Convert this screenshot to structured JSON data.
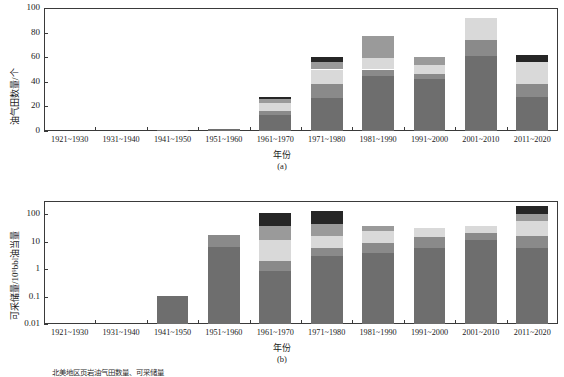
{
  "figure": {
    "caption": "北美地区页岩油气田数量、可采储量",
    "width": 564,
    "height": 377
  },
  "series": [
    {
      "name": "series-1",
      "color": "#6e6e6e"
    },
    {
      "name": "series-2",
      "color": "#8a8a8a"
    },
    {
      "name": "series-3",
      "color": "#d9d9d9"
    },
    {
      "name": "series-4",
      "color": "#9a9a9a"
    },
    {
      "name": "series-5",
      "color": "#262626"
    }
  ],
  "chart_data": [
    {
      "type": "bar",
      "id": "a",
      "subcaption": "(a)",
      "title": "",
      "xlabel": "年份",
      "ylabel": "油气田数量/个",
      "scale": "linear",
      "ylim": [
        0,
        100
      ],
      "yticks": [
        0,
        20,
        40,
        60,
        80,
        100
      ],
      "ytick_labels": [
        "0",
        "20",
        "40",
        "60",
        "80",
        "100"
      ],
      "grid": false,
      "legend": "none",
      "categories": [
        "1921~1930",
        "1931~1940",
        "1941~1950",
        "1951~1960",
        "1961~1970",
        "1971~1980",
        "1981~1990",
        "1991~2000",
        "2001~2010",
        "2011~2020"
      ],
      "series": [
        {
          "name": "series-1",
          "values": [
            0,
            0,
            0.6,
            1.4,
            13,
            27,
            45,
            42,
            61,
            28
          ]
        },
        {
          "name": "series-2",
          "values": [
            0,
            0,
            0,
            0,
            3,
            11,
            5,
            4,
            13,
            10
          ]
        },
        {
          "name": "series-3",
          "values": [
            0,
            0,
            0,
            0,
            7,
            12,
            9,
            8,
            18,
            18
          ]
        },
        {
          "name": "series-4",
          "values": [
            0,
            0,
            0,
            0,
            3,
            6,
            18,
            6,
            0,
            0
          ]
        },
        {
          "name": "series-5",
          "values": [
            0,
            0,
            0,
            0,
            2,
            4,
            0,
            0,
            0,
            6
          ]
        }
      ],
      "totals": [
        0,
        0,
        0.6,
        1.4,
        28,
        60,
        77,
        60,
        92,
        62
      ]
    },
    {
      "type": "bar",
      "id": "b",
      "subcaption": "(b)",
      "title": "",
      "xlabel": "年份",
      "ylabel": "可采储量/10⁹bbl油当量",
      "scale": "log",
      "ylim": [
        0.01,
        300
      ],
      "yticks": [
        0.01,
        0.1,
        1,
        10,
        100
      ],
      "ytick_labels": [
        "0.01",
        "0.1",
        "1",
        "10",
        "100"
      ],
      "grid": false,
      "legend": "none",
      "categories": [
        "1921~1930",
        "1931~1940",
        "1941~1950",
        "1951~1960",
        "1961~1970",
        "1971~1980",
        "1981~1990",
        "1991~2000",
        "2001~2010",
        "2011~2020"
      ],
      "cumulative_breaks": [
        {
          "category": "1921~1930",
          "stops": []
        },
        {
          "category": "1931~1940",
          "stops": []
        },
        {
          "category": "1941~1950",
          "stops": [
            0.105
          ]
        },
        {
          "category": "1951~1960",
          "stops": [
            6.5,
            18
          ]
        },
        {
          "category": "1961~1970",
          "stops": [
            0.85,
            2.0,
            11,
            38,
            110
          ]
        },
        {
          "category": "1971~1980",
          "stops": [
            3.0,
            6.0,
            16,
            45,
            130
          ]
        },
        {
          "category": "1981~1990",
          "stops": [
            4.0,
            9.0,
            24,
            36
          ]
        },
        {
          "category": "1991~2000",
          "stops": [
            6.0,
            15,
            30
          ]
        },
        {
          "category": "2001~2010",
          "stops": [
            11,
            20,
            38
          ]
        },
        {
          "category": "2011~2020",
          "stops": [
            6.0,
            16,
            55,
            100,
            190
          ]
        }
      ],
      "totals": [
        0,
        0,
        0.105,
        18,
        110,
        130,
        36,
        30,
        38,
        190
      ]
    }
  ]
}
